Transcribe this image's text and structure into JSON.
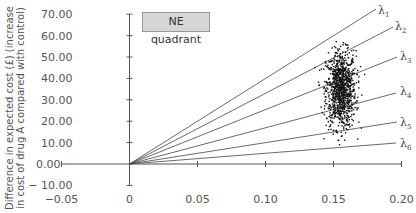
{
  "chart_data": {
    "type": "scatter",
    "title": "",
    "xlabel": "",
    "ylabel": "Difference in expected cost (£) (increase in cost of drug A compared with control)",
    "ylabel_line1": "Difference in expected cost (£) (increase",
    "ylabel_line2": "in cost of drug A compared with control)",
    "xlim": [
      -0.05,
      0.2
    ],
    "ylim": [
      -10,
      70
    ],
    "x_ticks": [
      "-0.05",
      "0",
      "0.05",
      "0.10",
      "0.15",
      "0.20"
    ],
    "y_ticks": [
      "70.00",
      "60.00",
      "50.00",
      "40.00",
      "30.00",
      "20.00",
      "10.00",
      "0.00",
      "-10.00"
    ],
    "grid": false,
    "annotation": "NE quadrant",
    "scatter_cloud": {
      "x_center": 0.155,
      "y_center": 35,
      "x_range": [
        0.14,
        0.17
      ],
      "y_range": [
        8,
        64
      ],
      "n_points_approx": 1000
    },
    "threshold_lines": [
      {
        "label": "λ",
        "sub": "1",
        "slope_per_unit_x": 400,
        "end": [
          0.18,
          68
        ]
      },
      {
        "label": "λ",
        "sub": "2",
        "slope_per_unit_x": 305,
        "end": [
          0.195,
          60
        ]
      },
      {
        "label": "λ",
        "sub": "3",
        "slope_per_unit_x": 245,
        "end": [
          0.198,
          50
        ]
      },
      {
        "label": "λ",
        "sub": "4",
        "slope_per_unit_x": 165,
        "end": [
          0.197,
          33
        ]
      },
      {
        "label": "λ",
        "sub": "5",
        "slope_per_unit_x": 98,
        "end": [
          0.198,
          20
        ]
      },
      {
        "label": "λ",
        "sub": "6",
        "slope_per_unit_x": 50,
        "end": [
          0.197,
          10
        ]
      }
    ]
  }
}
